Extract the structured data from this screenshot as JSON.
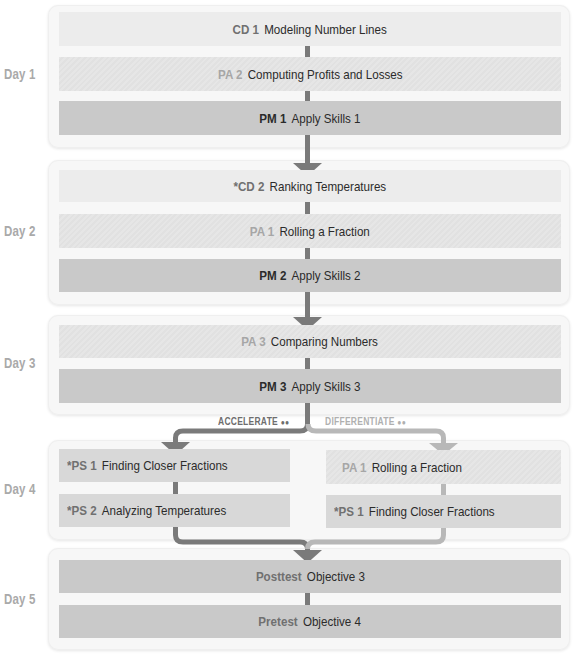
{
  "days": [
    {
      "label": "Day 1"
    },
    {
      "label": "Day 2"
    },
    {
      "label": "Day 3"
    },
    {
      "label": "Day 4"
    },
    {
      "label": "Day 5"
    }
  ],
  "day1": {
    "items": [
      {
        "code": "CD 1",
        "name": "Modeling Number Lines",
        "style": "light"
      },
      {
        "code": "PA 2",
        "name": "Computing Profits and Losses",
        "style": "hatch"
      },
      {
        "code": "PM 1",
        "name": "Apply Skills 1",
        "style": "dark"
      }
    ]
  },
  "day2": {
    "items": [
      {
        "code": "*CD 2",
        "name": "Ranking Temperatures",
        "style": "light"
      },
      {
        "code": "PA 1",
        "name": "Rolling a Fraction",
        "style": "hatch"
      },
      {
        "code": "PM 2",
        "name": "Apply Skills 2",
        "style": "dark"
      }
    ]
  },
  "day3": {
    "items": [
      {
        "code": "PA 3",
        "name": "Comparing Numbers",
        "style": "hatch"
      },
      {
        "code": "PM 3",
        "name": "Apply Skills 3",
        "style": "dark"
      }
    ],
    "branches": {
      "accelerate": "ACCELERATE",
      "differentiate": "DIFFERENTIATE",
      "group_icon": "👥"
    }
  },
  "day4": {
    "accelerate": [
      {
        "code": "*PS 1",
        "name": "Finding Closer Fractions",
        "style": "mid"
      },
      {
        "code": "*PS 2",
        "name": "Analyzing Temperatures",
        "style": "mid"
      }
    ],
    "differentiate": [
      {
        "code": "PA 1",
        "name": "Rolling a Fraction",
        "style": "hatch"
      },
      {
        "code": "*PS 1",
        "name": "Finding Closer Fractions",
        "style": "mid"
      }
    ]
  },
  "day5": {
    "items": [
      {
        "code": "Posttest",
        "name": "Objective 3",
        "style": "dark"
      },
      {
        "code": "Pretest",
        "name": "Objective 4",
        "style": "dark"
      }
    ]
  },
  "colors": {
    "connector_dark": "#7a7a7a",
    "connector_light": "#b8b8b8",
    "bar_light": "#ececec",
    "bar_dark": "#c9c9c9",
    "bar_mid": "#d8d8d8",
    "day_label": "#a9a9a9",
    "code_gray": "#a6a6a6",
    "code_dark": "#707070"
  }
}
